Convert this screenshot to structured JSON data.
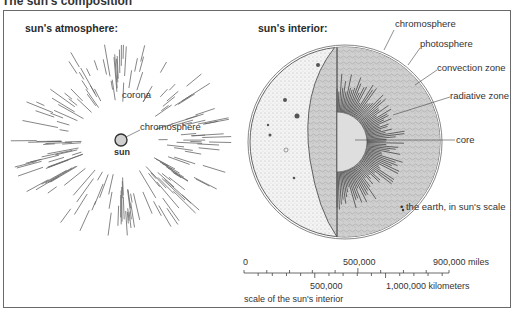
{
  "page": {
    "title": "The sun's composition"
  },
  "atmosphere_panel": {
    "heading": "sun's atmosphere:",
    "labels": {
      "corona": "corona",
      "chromosphere": "chromosphere",
      "sun": "sun"
    }
  },
  "interior_panel": {
    "heading": "sun's interior:",
    "layers": [
      {
        "label": "chromosphere"
      },
      {
        "label": "photosphere"
      },
      {
        "label": "convection zone"
      },
      {
        "label": "radiative zone"
      },
      {
        "label": "core"
      }
    ],
    "earth_note": "• the earth, in sun's scale"
  },
  "scale": {
    "miles_labels": [
      "0",
      "500,000",
      "900,000 miles"
    ],
    "km_labels": [
      "500,000",
      "1,000,000 kilometers"
    ],
    "caption": "scale of the sun's interior"
  },
  "colors": {
    "frame": "#6a6a6a",
    "line": "#555555",
    "sun_fill": "#d0d0d0",
    "core_fill": "#dedede",
    "surface_fill": "#f3f3f3",
    "interior_fill": "#c9c9c9"
  }
}
